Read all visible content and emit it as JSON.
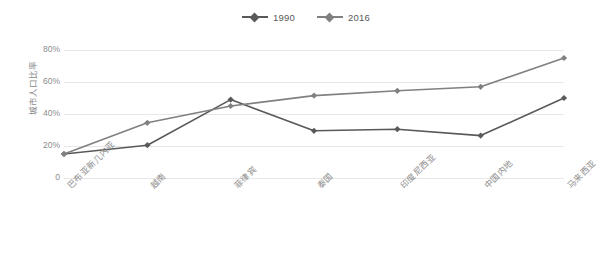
{
  "chart_data": {
    "type": "line",
    "title": "",
    "xlabel": "",
    "ylabel": "城市人口比率",
    "categories": [
      "巴布亚新几内亚",
      "越南",
      "菲律宾",
      "泰国",
      "印度尼西亚",
      "中国内地",
      "马来西亚"
    ],
    "series": [
      {
        "name": "1990",
        "color": "#595959",
        "values": [
          15,
          20.5,
          49,
          29.5,
          30.5,
          26.5,
          50
        ]
      },
      {
        "name": "2016",
        "color": "#808080",
        "values": [
          15,
          34.5,
          45,
          51.5,
          54.5,
          57,
          75
        ]
      }
    ],
    "ylim": [
      0,
      85
    ],
    "yticks": [
      0,
      20,
      40,
      60,
      80
    ],
    "ytick_labels": [
      "0",
      "20%",
      "40%",
      "60%",
      "80%"
    ],
    "grid": true,
    "legend_position": "top-center"
  },
  "legend": {
    "entries": [
      {
        "label": "1990"
      },
      {
        "label": "2016"
      }
    ]
  }
}
